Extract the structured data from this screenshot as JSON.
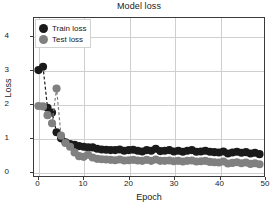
{
  "chart_data": {
    "type": "scatter",
    "title": "Model loss",
    "xlabel": "Epoch",
    "ylabel": "Loss",
    "xlim": [
      -1,
      50
    ],
    "ylim": [
      -0.15,
      4.55
    ],
    "xticks": [
      0,
      10,
      20,
      30,
      40,
      50
    ],
    "yticks": [
      0,
      1,
      2,
      3,
      4
    ],
    "grid": true,
    "legend_position": "upper left",
    "linestyle": "dashed",
    "marker": "circle",
    "series": [
      {
        "name": "Train loss",
        "color": "#1a1a1a",
        "x": [
          0,
          1,
          2,
          3,
          4,
          5,
          6,
          7,
          8,
          9,
          10,
          11,
          12,
          13,
          14,
          15,
          16,
          17,
          18,
          19,
          20,
          21,
          22,
          23,
          24,
          25,
          26,
          27,
          28,
          29,
          30,
          31,
          32,
          33,
          34,
          35,
          36,
          37,
          38,
          39,
          40,
          41,
          42,
          43,
          44,
          45,
          46,
          47,
          48,
          49
        ],
        "values": [
          3.0,
          3.1,
          1.88,
          1.74,
          1.15,
          0.97,
          0.85,
          0.8,
          0.78,
          0.74,
          0.72,
          0.7,
          0.7,
          0.66,
          0.64,
          0.63,
          0.62,
          0.62,
          0.64,
          0.6,
          0.62,
          0.63,
          0.6,
          0.58,
          0.62,
          0.6,
          0.66,
          0.59,
          0.6,
          0.62,
          0.58,
          0.6,
          0.57,
          0.6,
          0.62,
          0.57,
          0.58,
          0.6,
          0.57,
          0.56,
          0.55,
          0.58,
          0.52,
          0.55,
          0.57,
          0.54,
          0.56,
          0.52,
          0.54,
          0.5
        ]
      },
      {
        "name": "Test loss",
        "color": "#808080",
        "x": [
          0,
          1,
          2,
          3,
          4,
          5,
          6,
          7,
          8,
          9,
          10,
          11,
          12,
          13,
          14,
          15,
          16,
          17,
          18,
          19,
          20,
          21,
          22,
          23,
          24,
          25,
          26,
          27,
          28,
          29,
          30,
          31,
          32,
          33,
          34,
          35,
          36,
          37,
          38,
          39,
          40,
          41,
          42,
          43,
          44,
          45,
          46,
          47,
          48,
          49
        ],
        "values": [
          1.93,
          1.92,
          1.66,
          1.42,
          2.45,
          1.05,
          0.83,
          0.72,
          0.55,
          0.44,
          0.42,
          0.48,
          0.4,
          0.36,
          0.35,
          0.34,
          0.33,
          0.32,
          0.34,
          0.31,
          0.32,
          0.33,
          0.31,
          0.3,
          0.33,
          0.3,
          0.34,
          0.3,
          0.3,
          0.31,
          0.29,
          0.3,
          0.28,
          0.3,
          0.31,
          0.28,
          0.29,
          0.3,
          0.27,
          0.26,
          0.25,
          0.28,
          0.22,
          0.24,
          0.26,
          0.23,
          0.25,
          0.21,
          0.23,
          0.2
        ]
      }
    ]
  },
  "legend": {
    "entries": [
      {
        "label": "Train loss",
        "color": "#1a1a1a"
      },
      {
        "label": "Test loss",
        "color": "#808080"
      }
    ]
  },
  "axis": {
    "xticklabels": [
      "0",
      "10",
      "20",
      "30",
      "40",
      "50"
    ],
    "yticklabels": [
      "0",
      "1",
      "2",
      "3",
      "4"
    ]
  },
  "colors": {
    "train": "#1a1a1a",
    "test": "#808080",
    "grid": "#cfcfcf",
    "frame": "#3a3a3a",
    "background": "#ffffff"
  }
}
